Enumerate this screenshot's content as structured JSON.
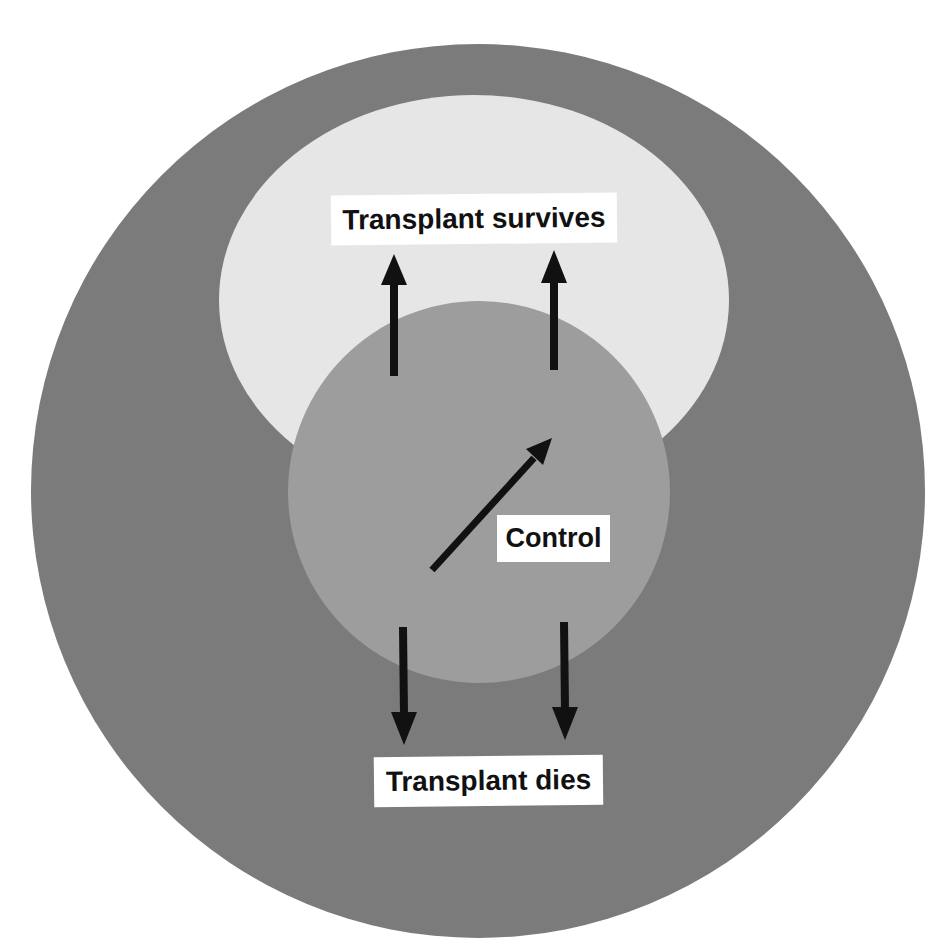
{
  "diagram": {
    "labels": {
      "survives": "Transplant survives",
      "control": "Control",
      "dies": "Transplant dies"
    },
    "colors": {
      "background": "#ffffff",
      "outer_region": "#7b7b7b",
      "survival_region": "#e6e6e6",
      "control_region": "#9d9d9d",
      "arrow": "#111111",
      "label_box": "#ffffff"
    },
    "regions": [
      {
        "name": "outer-region",
        "shape": "circle",
        "meaning": "Transplant dies"
      },
      {
        "name": "survival-region",
        "shape": "ellipse",
        "meaning": "Transplant survives"
      },
      {
        "name": "control-region",
        "shape": "circle",
        "meaning": "Control"
      }
    ],
    "arrows": [
      {
        "name": "arrow-up-left",
        "direction": "up",
        "target": "Transplant survives"
      },
      {
        "name": "arrow-up-right",
        "direction": "up",
        "target": "Transplant survives"
      },
      {
        "name": "arrow-diagonal",
        "direction": "up-right",
        "target": "Transplant survives"
      },
      {
        "name": "arrow-down-left",
        "direction": "down",
        "target": "Transplant dies"
      },
      {
        "name": "arrow-down-right",
        "direction": "down",
        "target": "Transplant dies"
      }
    ]
  }
}
